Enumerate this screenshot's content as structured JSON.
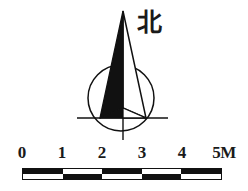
{
  "legend": {
    "background_color": "#ffffff",
    "ink_color": "#111111",
    "compass": {
      "north_label": "北",
      "north_label_meaning": "north",
      "needle_icon": "north-arrow-icon",
      "circle_icon": "compass-circle-icon",
      "crosshair_icon": "compass-crosshair-icon",
      "circle": {
        "cx": 121,
        "cy": 98,
        "r": 33
      },
      "needle": {
        "tip_x": 123,
        "tip_y": 11,
        "base_left_x": 100,
        "base_right_x": 146,
        "base_y": 118
      },
      "axis_horizontal": {
        "x1": 77,
        "x2": 168,
        "y": 118
      },
      "axis_vertical": {
        "x": 123,
        "y1": 30,
        "y2": 140
      }
    },
    "scalebar": {
      "icon": "scale-bar-icon",
      "unit": "M",
      "segment_count": 5,
      "start_x": 22,
      "end_x": 222,
      "top_y": 168,
      "height": 12,
      "tick_values": [
        "0",
        "1",
        "2",
        "3",
        "4",
        "5"
      ],
      "tick_labels": [
        {
          "text": "0",
          "x": 22
        },
        {
          "text": "1",
          "x": 62
        },
        {
          "text": "2",
          "x": 102
        },
        {
          "text": "3",
          "x": 142
        },
        {
          "text": "4",
          "x": 182
        },
        {
          "text": "5M",
          "x": 222
        }
      ],
      "cells": [
        {
          "row": "top",
          "index": 0,
          "fill": true
        },
        {
          "row": "top",
          "index": 1,
          "fill": false
        },
        {
          "row": "top",
          "index": 2,
          "fill": true
        },
        {
          "row": "top",
          "index": 3,
          "fill": false
        },
        {
          "row": "top",
          "index": 4,
          "fill": true
        },
        {
          "row": "bottom",
          "index": 0,
          "fill": false
        },
        {
          "row": "bottom",
          "index": 1,
          "fill": true
        },
        {
          "row": "bottom",
          "index": 2,
          "fill": false
        },
        {
          "row": "bottom",
          "index": 3,
          "fill": true
        },
        {
          "row": "bottom",
          "index": 4,
          "fill": false
        }
      ]
    }
  }
}
